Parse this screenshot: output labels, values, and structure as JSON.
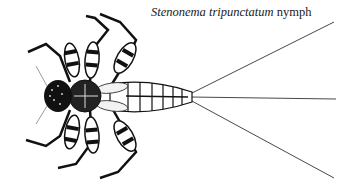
{
  "caption": {
    "genus_species": "Stenonema tripunctatum",
    "stage": "nymph"
  },
  "illustration": {
    "subject": "mayfly nymph, dorsal view",
    "style": "black and white pen illustration",
    "ink_color": "#111111",
    "background": "#ffffff"
  }
}
